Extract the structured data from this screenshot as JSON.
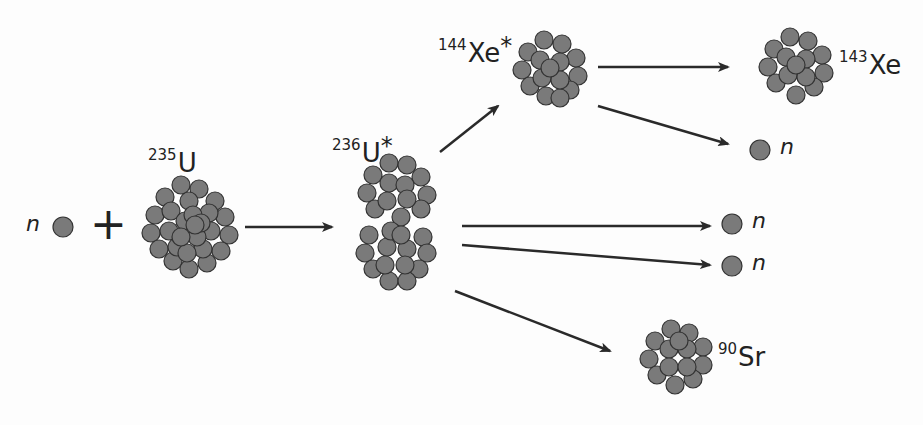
{
  "diagram": {
    "colors": {
      "nucleon_fill": "#7a7a7a",
      "nucleon_stroke": "#333333",
      "arrow": "#2a2a2a",
      "background": "#fdfdfd"
    },
    "reactants": {
      "neutron_label": "n",
      "plus": "+",
      "u235": {
        "mass": "235",
        "symbol": "U"
      }
    },
    "intermediate": {
      "mass": "236",
      "symbol": "U",
      "excited": "*"
    },
    "products": {
      "xe144": {
        "mass": "144",
        "symbol": "Xe",
        "excited": "*"
      },
      "xe143": {
        "mass": "143",
        "symbol": "Xe"
      },
      "sr90": {
        "mass": "90",
        "symbol": "Sr"
      },
      "neutron1_label": "n",
      "neutron2_label": "n",
      "neutron3_label": "n"
    }
  }
}
